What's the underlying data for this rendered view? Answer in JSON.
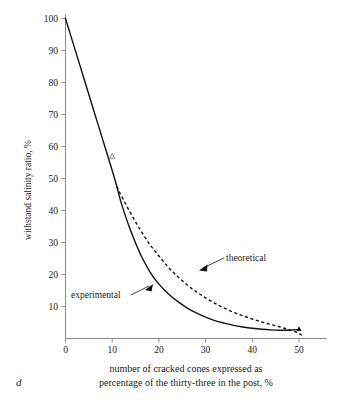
{
  "figure": {
    "label": "d",
    "background_color": "#ffffff",
    "ink_color": "#111111",
    "axis_color": "#8a8a8a"
  },
  "chart_data": {
    "type": "line",
    "title": "",
    "xlabel": "number of cracked cones expressed as percentage of the thirty-three in the post, %",
    "ylabel": "withstand salinity ratio, %",
    "xlim": [
      0,
      52
    ],
    "ylim": [
      0,
      100
    ],
    "xticks": [
      0,
      10,
      20,
      30,
      40,
      50
    ],
    "xtick_labels": [
      "0",
      "10",
      "20",
      "30",
      "40",
      "50"
    ],
    "yticks": [
      10,
      20,
      30,
      40,
      50,
      60,
      70,
      80,
      90,
      100
    ],
    "ytick_labels": [
      "10",
      "20",
      "30",
      "40",
      "50",
      "60",
      "70",
      "80",
      "90",
      "100"
    ],
    "grid": false,
    "legend_position": "inline-annotations",
    "series": [
      {
        "name": "experimental",
        "style": "solid",
        "x": [
          0,
          2,
          4,
          6,
          8,
          10,
          11,
          12,
          14,
          16,
          18,
          20,
          22,
          24,
          26,
          28,
          30,
          32,
          34,
          36,
          38,
          40,
          42,
          44,
          46,
          48,
          50
        ],
        "values": [
          100,
          90.5,
          81,
          71.5,
          62,
          52.5,
          47.5,
          42,
          33.5,
          26.5,
          21,
          17,
          14,
          11.6,
          9.6,
          8.0,
          6.7,
          5.6,
          4.8,
          4.1,
          3.6,
          3.2,
          2.9,
          2.7,
          2.6,
          2.6,
          2.8
        ]
      },
      {
        "name": "theoretical",
        "style": "dashed",
        "x": [
          11,
          12,
          14,
          16,
          18,
          20,
          22,
          24,
          26,
          28,
          30,
          32,
          34,
          36,
          38,
          40,
          42,
          44,
          46,
          48,
          50,
          51
        ],
        "values": [
          47.5,
          44.5,
          39.0,
          34.0,
          29.5,
          25.8,
          22.3,
          19.4,
          16.8,
          14.6,
          12.7,
          11.0,
          9.5,
          8.2,
          7.1,
          6.1,
          5.2,
          4.4,
          3.6,
          2.7,
          1.6,
          0.6
        ]
      }
    ],
    "markers": [
      {
        "series": "experimental",
        "x": 10,
        "y": 57,
        "shape": "open-triangle"
      },
      {
        "series": "experimental",
        "x": 50,
        "y": 3,
        "shape": "solid-triangle"
      }
    ],
    "annotations": [
      {
        "text": "theoretical",
        "text_x": 24.5,
        "text_y": 24.5,
        "point_x": 21.5,
        "point_y": 22.5
      },
      {
        "text": "experimental",
        "text_x": 5.5,
        "text_y": 13.5,
        "point_x": 18,
        "point_y": 15
      }
    ]
  },
  "caption": {
    "line1": "number of cracked cones expressed as",
    "line2": "percentage of the thirty-three in the post, %"
  }
}
